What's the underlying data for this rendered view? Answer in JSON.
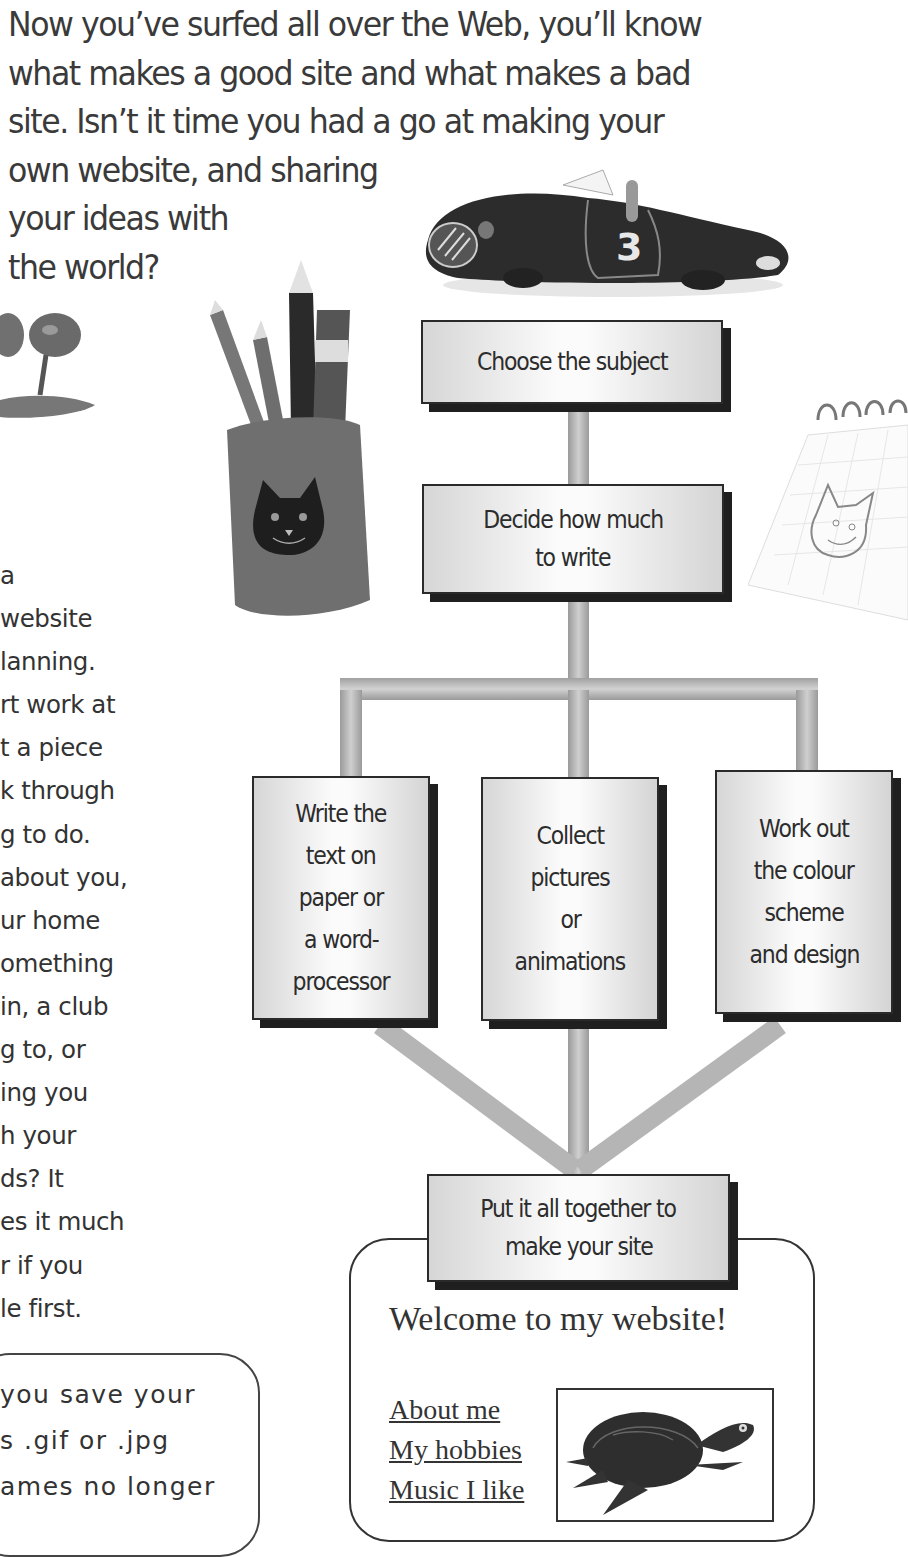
{
  "intro": {
    "lines": [
      "Now you’ve surfed all over the Web, you’ll know",
      "what makes a good site and what makes a bad",
      "site. Isn’t it time you had a go at making your",
      "own website, and sharing",
      "your ideas with",
      "the world?"
    ]
  },
  "side_text": {
    "lines": [
      "a",
      "website",
      "lanning.",
      "rt work at",
      "t a piece",
      "k through",
      "g to do.",
      "about you,",
      "ur home",
      "omething",
      "in, a club",
      "g to, or",
      "ing you",
      "h your",
      "ds? It",
      "es it much",
      "r if you",
      "le first."
    ]
  },
  "flowchart": {
    "step1": "Choose the subject",
    "step2": [
      "Decide how much",
      "to write"
    ],
    "branches": [
      [
        "Write the",
        "text on",
        "paper or",
        "a word-",
        "processor"
      ],
      [
        "Collect",
        "pictures",
        "or",
        "animations"
      ],
      [
        "Work out",
        "the colour",
        "scheme",
        "and design"
      ]
    ],
    "final": [
      "Put it all together to",
      "make your site"
    ]
  },
  "website_mock": {
    "title": "Welcome to my website!",
    "links": [
      "About me",
      "My hobbies",
      "Music I like"
    ],
    "image": "tortoise"
  },
  "tip": {
    "lines": [
      "you save your",
      "s .gif or .jpg",
      "ames no longer"
    ]
  },
  "illustrations": [
    "race-car-number-3",
    "trees-crayon-drawing",
    "pencil-pot-with-cat",
    "notepad-cat-sketch",
    "tortoise"
  ],
  "car_number": "3"
}
